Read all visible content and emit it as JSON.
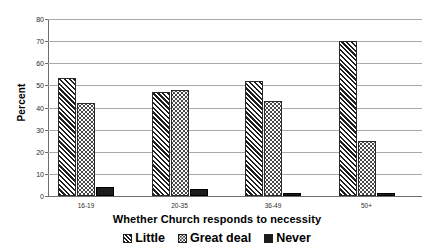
{
  "chart_data": {
    "type": "bar",
    "title": "",
    "xlabel": "Whether Church responds to necessity",
    "ylabel": "Percent",
    "categories": [
      "16-19",
      "20-35",
      "36-49",
      "50+"
    ],
    "series": [
      {
        "name": "Little",
        "values": [
          53.5,
          47.0,
          52.0,
          70.0
        ]
      },
      {
        "name": "Great deal",
        "values": [
          42.0,
          48.0,
          43.0,
          25.0
        ]
      },
      {
        "name": "Never",
        "values": [
          4.0,
          3.0,
          1.5,
          1.5
        ]
      }
    ],
    "ylim": [
      0,
      80
    ],
    "yticks": [
      0,
      10,
      20,
      30,
      40,
      50,
      60,
      70,
      80
    ],
    "ytick_labels": [
      "0",
      "10",
      "20",
      "30",
      "40",
      "50",
      "60",
      "70",
      "80"
    ],
    "grid": true,
    "legend_position": "bottom"
  },
  "legend": {
    "items": [
      {
        "label": "Little",
        "pattern": "diagonal-hatch"
      },
      {
        "label": "Great deal",
        "pattern": "dotted"
      },
      {
        "label": "Never",
        "pattern": "solid-black"
      }
    ]
  },
  "colors": {
    "background": "#ffffff",
    "axis": "#6d6d6d",
    "gridline": "#a9a9a9",
    "bar_outline": "#2a2a2a",
    "never_fill": "#1c1c1c",
    "text": "#000000"
  }
}
